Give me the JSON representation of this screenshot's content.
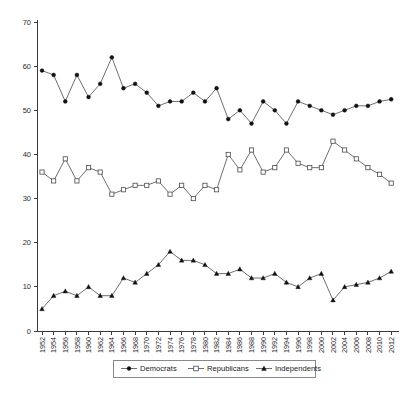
{
  "chart_data": {
    "type": "line",
    "title": "",
    "subtitle": "",
    "xlabel": "",
    "ylabel": "",
    "ylim": [
      0,
      70
    ],
    "ytick_step": 10,
    "yticks": [
      0,
      10,
      20,
      30,
      40,
      50,
      60,
      70
    ],
    "grid": false,
    "legend_position": "bottom",
    "x": [
      1952,
      1954,
      1956,
      1958,
      1960,
      1962,
      1964,
      1966,
      1968,
      1970,
      1972,
      1974,
      1976,
      1978,
      1980,
      1982,
      1984,
      1986,
      1988,
      1990,
      1992,
      1994,
      1996,
      1998,
      2000,
      2002,
      2004,
      2006,
      2008,
      2010,
      2012
    ],
    "categories": [
      "1952",
      "1954",
      "1956",
      "1958",
      "1960",
      "1962",
      "1964",
      "1966",
      "1968",
      "1970",
      "1972",
      "1974",
      "1976",
      "1978",
      "1980",
      "1982",
      "1984",
      "1986",
      "1988",
      "1990",
      "1992",
      "1994",
      "1996",
      "1998",
      "2000",
      "2002",
      "2004",
      "2006",
      "2008",
      "2010",
      "2012"
    ],
    "xtick_labels_shown": [
      "1952",
      "1954",
      "1956",
      "1958",
      "1960",
      "1962",
      "1964",
      "1966",
      "1968",
      "1970",
      "1972",
      "1974",
      "1976",
      "1978",
      "1980",
      "1982",
      "1984",
      "1986",
      "1988",
      "1990",
      "1992",
      "1994",
      "1996",
      "1998",
      "2000",
      "2002",
      "2004",
      "2006",
      "2008",
      "2010",
      "2012"
    ],
    "series": [
      {
        "name": "Democrats",
        "marker": "filled-circle",
        "values": [
          59,
          58,
          52,
          58,
          53,
          56,
          62,
          55,
          56,
          54,
          51,
          52,
          52,
          54,
          52,
          55,
          48,
          50,
          47,
          52,
          50,
          47,
          52,
          51,
          50,
          49,
          50,
          51,
          51,
          52,
          52.5
        ]
      },
      {
        "name": "Republicans",
        "marker": "open-square",
        "values": [
          36,
          34,
          39,
          34,
          37,
          36,
          31,
          32,
          33,
          33,
          34,
          31,
          33,
          30,
          33,
          32,
          40,
          36.5,
          41,
          36,
          37,
          41,
          38,
          37,
          37,
          43,
          41,
          39,
          37,
          35.5,
          33.5
        ]
      },
      {
        "name": "Independents",
        "marker": "filled-triangle",
        "values": [
          5,
          8,
          9,
          8,
          10,
          8,
          8,
          12,
          11,
          13,
          15,
          18,
          16,
          16,
          15,
          13,
          13,
          14,
          12,
          12,
          13,
          11,
          10,
          12,
          13,
          7,
          10,
          10.5,
          11,
          12,
          13.5
        ]
      }
    ],
    "legend_entries": [
      {
        "label": "Democrats",
        "marker": "filled-circle"
      },
      {
        "label": "Republicans",
        "marker": "open-square"
      },
      {
        "label": "Independents",
        "marker": "filled-triangle"
      }
    ]
  },
  "colors": {
    "background": "#ffffff",
    "axis": "#3a3a3a",
    "line": "#4a4a4a",
    "marker_fill_dark": "#111111",
    "marker_fill_light": "#ffffff",
    "text": "#1a1a1a"
  }
}
